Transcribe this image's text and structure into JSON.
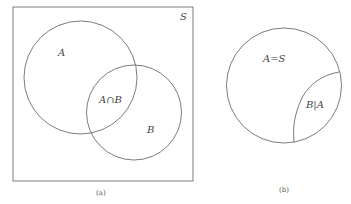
{
  "diagram": {
    "panel_a": {
      "universe_label": "S",
      "set_a_label": "A",
      "intersection_label": "A∩B",
      "set_b_label": "B",
      "caption": "(a)"
    },
    "panel_b": {
      "set_label": "A=S",
      "conditional_label": "B|A",
      "caption": "(b)"
    },
    "colors": {
      "stroke": "#5a5a5a",
      "background": "#ffffff"
    }
  }
}
